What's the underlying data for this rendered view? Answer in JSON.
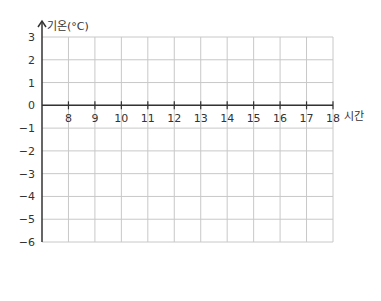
{
  "chart_data": {
    "type": "line",
    "title": "",
    "xlabel": "시간",
    "ylabel": "기온(°C)",
    "x_ticks": [
      "8",
      "9",
      "10",
      "11",
      "12",
      "13",
      "14",
      "15",
      "16",
      "17",
      "18"
    ],
    "y_ticks": [
      "3",
      "2",
      "1",
      "0",
      "-1",
      "-2",
      "-3",
      "-4",
      "-5",
      "-6"
    ],
    "xlim": [
      7,
      18
    ],
    "ylim": [
      -6,
      3
    ],
    "grid": true,
    "series": []
  },
  "colors": {
    "grid": "#c8c8c8",
    "axis": "#333333"
  }
}
